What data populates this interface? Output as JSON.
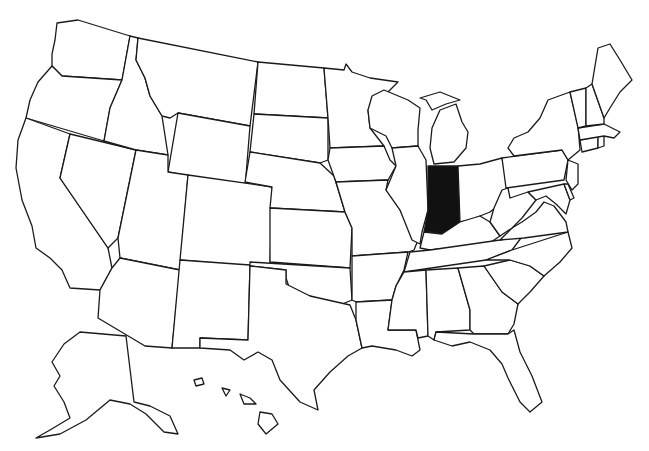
{
  "map": {
    "title": "",
    "type": "choropleth-outline",
    "region": "United States",
    "highlighted_states": [
      "Indiana"
    ],
    "colors": {
      "background": "#ffffff",
      "state_fill": "#ffffff",
      "border": "#1a1a1a",
      "highlight": "#111111"
    },
    "states": [
      "Washington",
      "Oregon",
      "California",
      "Nevada",
      "Idaho",
      "Montana",
      "Wyoming",
      "Utah",
      "Arizona",
      "Colorado",
      "New Mexico",
      "North Dakota",
      "South Dakota",
      "Nebraska",
      "Kansas",
      "Oklahoma",
      "Texas",
      "Minnesota",
      "Iowa",
      "Missouri",
      "Arkansas",
      "Louisiana",
      "Wisconsin",
      "Illinois",
      "Michigan",
      "Indiana",
      "Ohio",
      "Kentucky",
      "Tennessee",
      "Mississippi",
      "Alabama",
      "Georgia",
      "Florida",
      "South Carolina",
      "North Carolina",
      "Virginia",
      "West Virginia",
      "Pennsylvania",
      "New York",
      "Maryland",
      "Delaware",
      "New Jersey",
      "Connecticut",
      "Rhode Island",
      "Massachusetts",
      "Vermont",
      "New Hampshire",
      "Maine",
      "Alaska",
      "Hawaii"
    ]
  }
}
